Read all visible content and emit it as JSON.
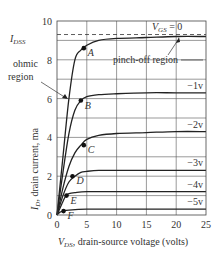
{
  "chart_data": {
    "type": "line",
    "title": "",
    "xlabel": "V_DS, drain-source voltage (volts)",
    "ylabel": "I_D, drain current, ma",
    "xlim": [
      0,
      25
    ],
    "ylim": [
      0,
      10
    ],
    "x_ticks": [
      "0",
      "5",
      "10",
      "15",
      "20",
      "25"
    ],
    "y_ticks": [
      "0",
      "2",
      "4",
      "6",
      "8",
      "10"
    ],
    "grid": true,
    "idss_label": "I_DSS",
    "idss_value": 9.2,
    "series": [
      {
        "name": "V_GS = 0",
        "label": "VGS = 0",
        "x": [
          0,
          1,
          2,
          3,
          4,
          5,
          7,
          10,
          15,
          20,
          25
        ],
        "values": [
          0,
          3.0,
          6.0,
          8.0,
          8.5,
          8.75,
          9.0,
          9.1,
          9.15,
          9.2,
          9.2
        ]
      },
      {
        "name": "-1v",
        "label": "−1v",
        "x": [
          0,
          1,
          2,
          3,
          4,
          5,
          7,
          10,
          15,
          20,
          25
        ],
        "values": [
          0,
          2.2,
          4.2,
          5.4,
          5.9,
          6.1,
          6.2,
          6.25,
          6.3,
          6.3,
          6.3
        ]
      },
      {
        "name": "-2v",
        "label": "−2v",
        "x": [
          0,
          1,
          2,
          3,
          4,
          5,
          7,
          10,
          15,
          20,
          25
        ],
        "values": [
          0,
          1.4,
          2.5,
          3.2,
          3.6,
          3.9,
          4.1,
          4.2,
          4.25,
          4.3,
          4.3
        ]
      },
      {
        "name": "-3v",
        "label": "−3v",
        "x": [
          0,
          1,
          2,
          3,
          4,
          5,
          7,
          10,
          15,
          20,
          25
        ],
        "values": [
          0,
          1.0,
          1.7,
          2.0,
          2.2,
          2.25,
          2.3,
          2.3,
          2.3,
          2.3,
          2.3
        ]
      },
      {
        "name": "-4v",
        "label": "−4v",
        "x": [
          0,
          1,
          1.5,
          2,
          3,
          5,
          10,
          15,
          20,
          25
        ],
        "values": [
          0,
          0.7,
          1.0,
          1.1,
          1.15,
          1.2,
          1.2,
          1.2,
          1.2,
          1.2
        ]
      },
      {
        "name": "-5v",
        "label": "−5v",
        "x": [
          0,
          0.5,
          1,
          2,
          5,
          10,
          15,
          20,
          25
        ],
        "values": [
          0,
          0.15,
          0.2,
          0.25,
          0.3,
          0.3,
          0.3,
          0.3,
          0.3
        ]
      }
    ],
    "points": [
      {
        "name": "A",
        "x": 4.5,
        "y": 8.6
      },
      {
        "name": "B",
        "x": 4.0,
        "y": 5.9
      },
      {
        "name": "C",
        "x": 4.5,
        "y": 3.6
      },
      {
        "name": "D",
        "x": 2.6,
        "y": 2.0
      },
      {
        "name": "E",
        "x": 1.6,
        "y": 1.0
      },
      {
        "name": "F",
        "x": 1.1,
        "y": 0.2
      }
    ],
    "annotations": [
      {
        "text": "ohmic region",
        "arrow_to": {
          "x": 2.0,
          "y": 6.0
        }
      },
      {
        "text": "pinch-off region",
        "arrow_to": {
          "x": 20,
          "y": 9.2
        }
      }
    ]
  },
  "labels": {
    "ohmic_line1": "ohmic",
    "ohmic_line2": "region",
    "pinchoff": "pinch-off region",
    "vgs_main": "V",
    "vgs_sub": "GS",
    "vgs_eq": " = 0",
    "idss_main": "I",
    "idss_sub": "DSS",
    "xlabel_v": "V",
    "xlabel_sub": "DS",
    "xlabel_rest": ", drain-source voltage (volts)",
    "ylabel_i": "I",
    "ylabel_sub": "D",
    "ylabel_rest": ", drain current, ma"
  }
}
